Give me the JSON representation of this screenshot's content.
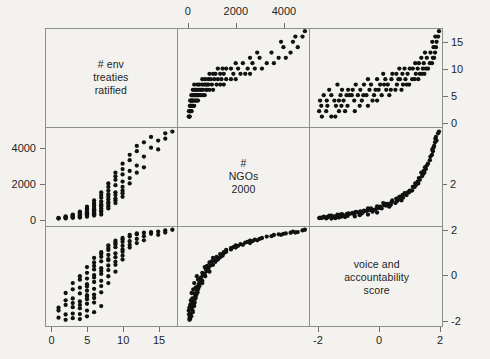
{
  "figure": {
    "type": "scatterplot-matrix",
    "background_color": "#f4f2ee",
    "point_color": "#111111",
    "frame_color": "#8e8e8e",
    "plot_area": {
      "left": 45,
      "top": 28,
      "width": 398,
      "height": 299
    },
    "panel_width": 132.6,
    "panel_height": 99.6
  },
  "variables": [
    {
      "key": "treaties",
      "label_lines": [
        "# env",
        "treaties",
        "ratified"
      ],
      "min": -0.9,
      "max": 17.6,
      "ticks": [
        0,
        5,
        10,
        15
      ],
      "tick_labels": [
        "0",
        "5",
        "10",
        "15"
      ]
    },
    {
      "key": "ngos",
      "label_lines": [
        "#",
        "NGOs",
        "2000"
      ],
      "min": -420,
      "max": 5100,
      "ticks": [
        0,
        2000,
        4000
      ],
      "tick_labels": [
        "0",
        "2000",
        "4000"
      ]
    },
    {
      "key": "voice",
      "label_lines": [
        "voice and",
        "accountability",
        "score"
      ],
      "min": -2.25,
      "max": 2.1,
      "ticks": [
        -2,
        0,
        2
      ],
      "tick_labels": [
        "-2",
        "0",
        "2"
      ]
    }
  ],
  "axes": {
    "top": {
      "variable": "ngos",
      "tick_labels": [
        "0",
        "2000",
        "4000"
      ],
      "ticks": [
        0,
        2000,
        4000
      ]
    },
    "bottom_left": {
      "variable": "treaties",
      "tick_labels": [
        "0",
        "5",
        "10",
        "15"
      ],
      "ticks": [
        0,
        5,
        10,
        15
      ]
    },
    "bottom_right": {
      "variable": "voice",
      "tick_labels": [
        "-2",
        "0",
        "2"
      ],
      "ticks": [
        -2,
        0,
        2
      ]
    },
    "left": {
      "variable": "ngos",
      "tick_labels": [
        "4000",
        "2000",
        "0"
      ],
      "ticks": [
        4000,
        2000,
        0
      ]
    },
    "right_top": {
      "variable": "treaties",
      "tick_labels": [
        "15",
        "10",
        "5",
        "0"
      ],
      "ticks": [
        15,
        10,
        5,
        0
      ]
    },
    "right_bottom": {
      "variable": "voice",
      "tick_labels": [
        "2",
        "0",
        "-2"
      ],
      "ticks": [
        2,
        0,
        -2
      ]
    },
    "right_mid_partial": {
      "variable": "ngos",
      "tick_labels": [
        "2"
      ],
      "ticks": [
        2000
      ]
    }
  },
  "chart_data": {
    "type": "scatter",
    "title": "",
    "xlabel": "",
    "ylabel": "",
    "grid": false,
    "legend": "none",
    "matrix_order": [
      "treaties",
      "ngos",
      "voice"
    ],
    "axis_ranges": {
      "treaties": [
        -0.9,
        17.6
      ],
      "ngos": [
        -420,
        5100
      ],
      "voice": [
        -2.25,
        2.1
      ]
    },
    "points": [
      {
        "treaties": 1,
        "ngos": 30,
        "voice": -1.55
      },
      {
        "treaties": 1,
        "ngos": 55,
        "voice": -1.42
      },
      {
        "treaties": 1,
        "ngos": 70,
        "voice": -1.86
      },
      {
        "treaties": 2,
        "ngos": 40,
        "voice": -1.72
      },
      {
        "treaties": 2,
        "ngos": 90,
        "voice": -1.3
      },
      {
        "treaties": 2,
        "ngos": 120,
        "voice": -1.1
      },
      {
        "treaties": 2,
        "ngos": 60,
        "voice": -1.95
      },
      {
        "treaties": 2,
        "ngos": 150,
        "voice": -0.78
      },
      {
        "treaties": 3,
        "ngos": 110,
        "voice": -1.4
      },
      {
        "treaties": 3,
        "ngos": 180,
        "voice": -1.02
      },
      {
        "treaties": 3,
        "ngos": 220,
        "voice": -0.62
      },
      {
        "treaties": 3,
        "ngos": 95,
        "voice": -1.68
      },
      {
        "treaties": 3,
        "ngos": 260,
        "voice": -0.35
      },
      {
        "treaties": 3,
        "ngos": 140,
        "voice": -1.22
      },
      {
        "treaties": 3,
        "ngos": 75,
        "voice": -1.88
      },
      {
        "treaties": 4,
        "ngos": 200,
        "voice": -1.15
      },
      {
        "treaties": 4,
        "ngos": 320,
        "voice": -0.55
      },
      {
        "treaties": 4,
        "ngos": 150,
        "voice": -1.45
      },
      {
        "treaties": 4,
        "ngos": 420,
        "voice": -0.2
      },
      {
        "treaties": 4,
        "ngos": 260,
        "voice": -0.8
      },
      {
        "treaties": 4,
        "ngos": 110,
        "voice": -1.7
      },
      {
        "treaties": 4,
        "ngos": 370,
        "voice": -0.05
      },
      {
        "treaties": 4,
        "ngos": 180,
        "voice": -1.3
      },
      {
        "treaties": 4,
        "ngos": 90,
        "voice": -1.92
      },
      {
        "treaties": 5,
        "ngos": 300,
        "voice": -0.95
      },
      {
        "treaties": 5,
        "ngos": 450,
        "voice": -0.4
      },
      {
        "treaties": 5,
        "ngos": 250,
        "voice": -1.25
      },
      {
        "treaties": 5,
        "ngos": 600,
        "voice": 0.1
      },
      {
        "treaties": 5,
        "ngos": 380,
        "voice": -0.68
      },
      {
        "treaties": 5,
        "ngos": 190,
        "voice": -1.55
      },
      {
        "treaties": 5,
        "ngos": 520,
        "voice": -0.15
      },
      {
        "treaties": 5,
        "ngos": 330,
        "voice": -0.88
      },
      {
        "treaties": 5,
        "ngos": 140,
        "voice": -1.8
      },
      {
        "treaties": 5,
        "ngos": 700,
        "voice": 0.35
      },
      {
        "treaties": 5,
        "ngos": 280,
        "voice": -1.05
      },
      {
        "treaties": 5,
        "ngos": 410,
        "voice": -0.5
      },
      {
        "treaties": 6,
        "ngos": 500,
        "voice": -0.3
      },
      {
        "treaties": 6,
        "ngos": 750,
        "voice": 0.25
      },
      {
        "treaties": 6,
        "ngos": 350,
        "voice": -0.85
      },
      {
        "treaties": 6,
        "ngos": 900,
        "voice": 0.55
      },
      {
        "treaties": 6,
        "ngos": 620,
        "voice": 0.0
      },
      {
        "treaties": 6,
        "ngos": 280,
        "voice": -1.2
      },
      {
        "treaties": 6,
        "ngos": 1050,
        "voice": 0.75
      },
      {
        "treaties": 6,
        "ngos": 430,
        "voice": -0.6
      },
      {
        "treaties": 6,
        "ngos": 200,
        "voice": -1.62
      },
      {
        "treaties": 6,
        "ngos": 800,
        "voice": 0.4
      },
      {
        "treaties": 6,
        "ngos": 550,
        "voice": -0.1
      },
      {
        "treaties": 6,
        "ngos": 320,
        "voice": -1.0
      },
      {
        "treaties": 7,
        "ngos": 850,
        "voice": 0.3
      },
      {
        "treaties": 7,
        "ngos": 1200,
        "voice": 0.8
      },
      {
        "treaties": 7,
        "ngos": 600,
        "voice": -0.25
      },
      {
        "treaties": 7,
        "ngos": 1500,
        "voice": 1.0
      },
      {
        "treaties": 7,
        "ngos": 700,
        "voice": 0.05
      },
      {
        "treaties": 7,
        "ngos": 400,
        "voice": -0.75
      },
      {
        "treaties": 7,
        "ngos": 1000,
        "voice": 0.6
      },
      {
        "treaties": 7,
        "ngos": 480,
        "voice": -0.48
      },
      {
        "treaties": 7,
        "ngos": 260,
        "voice": -1.35
      },
      {
        "treaties": 7,
        "ngos": 1350,
        "voice": 0.92
      },
      {
        "treaties": 7,
        "ngos": 780,
        "voice": 0.18
      },
      {
        "treaties": 8,
        "ngos": 1100,
        "voice": 0.65
      },
      {
        "treaties": 8,
        "ngos": 1600,
        "voice": 1.1
      },
      {
        "treaties": 8,
        "ngos": 850,
        "voice": 0.22
      },
      {
        "treaties": 8,
        "ngos": 2000,
        "voice": 1.3
      },
      {
        "treaties": 8,
        "ngos": 950,
        "voice": 0.42
      },
      {
        "treaties": 8,
        "ngos": 600,
        "voice": -0.35
      },
      {
        "treaties": 8,
        "ngos": 1400,
        "voice": 0.88
      },
      {
        "treaties": 8,
        "ngos": 720,
        "voice": -0.05
      },
      {
        "treaties": 8,
        "ngos": 1800,
        "voice": 1.18
      },
      {
        "treaties": 8,
        "ngos": 1250,
        "voice": 0.7
      },
      {
        "treaties": 9,
        "ngos": 1500,
        "voice": 0.95
      },
      {
        "treaties": 9,
        "ngos": 2200,
        "voice": 1.35
      },
      {
        "treaties": 9,
        "ngos": 1150,
        "voice": 0.58
      },
      {
        "treaties": 9,
        "ngos": 2600,
        "voice": 1.5
      },
      {
        "treaties": 9,
        "ngos": 1350,
        "voice": 0.78
      },
      {
        "treaties": 9,
        "ngos": 900,
        "voice": 0.15
      },
      {
        "treaties": 9,
        "ngos": 1900,
        "voice": 1.22
      },
      {
        "treaties": 9,
        "ngos": 1050,
        "voice": 0.45
      },
      {
        "treaties": 9,
        "ngos": 2400,
        "voice": 1.42
      },
      {
        "treaties": 10,
        "ngos": 2100,
        "voice": 1.28
      },
      {
        "treaties": 10,
        "ngos": 2800,
        "voice": 1.55
      },
      {
        "treaties": 10,
        "ngos": 1600,
        "voice": 1.02
      },
      {
        "treaties": 10,
        "ngos": 3100,
        "voice": 1.62
      },
      {
        "treaties": 10,
        "ngos": 1800,
        "voice": 1.12
      },
      {
        "treaties": 10,
        "ngos": 1250,
        "voice": 0.68
      },
      {
        "treaties": 10,
        "ngos": 2500,
        "voice": 1.45
      },
      {
        "treaties": 10,
        "ngos": 1450,
        "voice": 0.85
      },
      {
        "treaties": 11,
        "ngos": 2700,
        "voice": 1.48
      },
      {
        "treaties": 11,
        "ngos": 3300,
        "voice": 1.68
      },
      {
        "treaties": 11,
        "ngos": 2000,
        "voice": 1.2
      },
      {
        "treaties": 11,
        "ngos": 3600,
        "voice": 1.75
      },
      {
        "treaties": 11,
        "ngos": 2300,
        "voice": 1.32
      },
      {
        "treaties": 12,
        "ngos": 3000,
        "voice": 1.58
      },
      {
        "treaties": 12,
        "ngos": 3800,
        "voice": 1.78
      },
      {
        "treaties": 12,
        "ngos": 2600,
        "voice": 1.4
      },
      {
        "treaties": 12,
        "ngos": 4100,
        "voice": 1.82
      },
      {
        "treaties": 13,
        "ngos": 3500,
        "voice": 1.7
      },
      {
        "treaties": 13,
        "ngos": 4300,
        "voice": 1.85
      },
      {
        "treaties": 13,
        "ngos": 2900,
        "voice": 1.52
      },
      {
        "treaties": 14,
        "ngos": 4000,
        "voice": 1.8
      },
      {
        "treaties": 14,
        "ngos": 4600,
        "voice": 1.88
      },
      {
        "treaties": 15,
        "ngos": 4400,
        "voice": 1.9
      },
      {
        "treaties": 15,
        "ngos": 3900,
        "voice": 1.76
      },
      {
        "treaties": 16,
        "ngos": 4800,
        "voice": 1.95
      },
      {
        "treaties": 16,
        "ngos": 4500,
        "voice": 1.86
      },
      {
        "treaties": 17,
        "ngos": 4900,
        "voice": 1.98
      }
    ]
  }
}
